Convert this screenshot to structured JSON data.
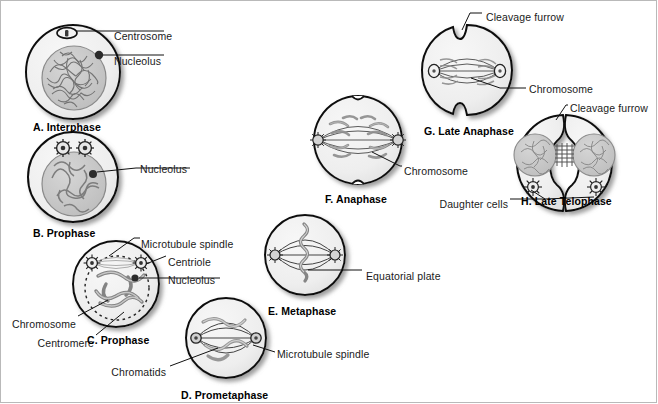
{
  "figure": {
    "background_color": "#ffffff",
    "cell_fill": "#efefef",
    "nucleus_fill": "#c9c9c9",
    "outline_color": "#000000",
    "text_color": "#1a1a1a",
    "shadow_color": "#9a9a9a"
  },
  "panels": [
    {
      "id": "A",
      "caption": "A. Interphase",
      "caption_x": 33,
      "caption_y": 122
    },
    {
      "id": "B",
      "caption": "B. Prophase",
      "caption_x": 33,
      "caption_y": 228
    },
    {
      "id": "C",
      "caption": "C. Prophase",
      "caption_x": 87,
      "caption_y": 335
    },
    {
      "id": "D",
      "caption": "D. Prometaphase",
      "caption_x": 181,
      "caption_y": 390
    },
    {
      "id": "E",
      "caption": "E. Metaphase",
      "caption_x": 268,
      "caption_y": 306
    },
    {
      "id": "F",
      "caption": "F. Anaphase",
      "caption_x": 325,
      "caption_y": 194
    },
    {
      "id": "G",
      "caption": "G. Late Anaphase",
      "caption_x": 424,
      "caption_y": 126
    },
    {
      "id": "H",
      "caption": "H. Late Telophase",
      "caption_x": 521,
      "caption_y": 196
    }
  ],
  "labels": [
    {
      "key": "a_centrosome",
      "text": "Centrosome",
      "x": 114,
      "y": 31,
      "align": "left"
    },
    {
      "key": "a_nucleolus",
      "text": "Nucleolus",
      "x": 114,
      "y": 56,
      "align": "left"
    },
    {
      "key": "b_nucleolus",
      "text": "Nucleolus",
      "x": 140,
      "y": 164,
      "align": "left"
    },
    {
      "key": "c_spindle",
      "text": "Microtubule spindle",
      "x": 141,
      "y": 239,
      "align": "left"
    },
    {
      "key": "c_centriole",
      "text": "Centriole",
      "x": 168,
      "y": 257,
      "align": "left"
    },
    {
      "key": "c_nucleolus",
      "text": "Nucleolus",
      "x": 168,
      "y": 275,
      "align": "left"
    },
    {
      "key": "c_chromosome",
      "text": "Chromosome",
      "x": 76,
      "y": 319,
      "align": "right"
    },
    {
      "key": "c_centromere",
      "text": "Centromere",
      "x": 94,
      "y": 338,
      "align": "right"
    },
    {
      "key": "d_chromatids",
      "text": "Chromatids",
      "x": 166,
      "y": 367,
      "align": "right"
    },
    {
      "key": "d_spindle",
      "text": "Microtubule spindle",
      "x": 277,
      "y": 349,
      "align": "left"
    },
    {
      "key": "e_eqplate",
      "text": "Equatorial plate",
      "x": 366,
      "y": 271,
      "align": "left"
    },
    {
      "key": "f_chromosome",
      "text": "Chromosome",
      "x": 404,
      "y": 166,
      "align": "left"
    },
    {
      "key": "g_furrow",
      "text": "Cleavage furrow",
      "x": 486,
      "y": 12,
      "align": "left"
    },
    {
      "key": "g_chromosome",
      "text": "Chromosome",
      "x": 529,
      "y": 84,
      "align": "left"
    },
    {
      "key": "h_furrow",
      "text": "Cleavage furrow",
      "x": 570,
      "y": 103,
      "align": "left"
    },
    {
      "key": "h_daughter",
      "text": "Daughter cells",
      "x": 508,
      "y": 199,
      "align": "right"
    }
  ]
}
